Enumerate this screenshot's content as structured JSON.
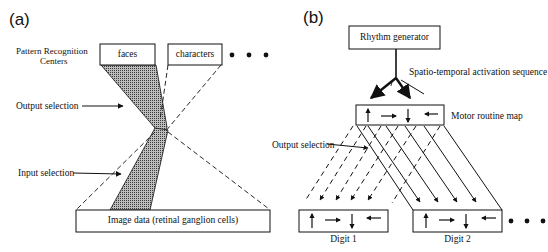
{
  "panel_a": {
    "label": "(a)",
    "pattern_recognition_label_line1": "Pattern Recognition",
    "pattern_recognition_label_line2": "Centers",
    "box_faces": "faces",
    "box_characters": "characters",
    "output_selection": "Output selection",
    "input_selection": "Input selection",
    "image_data": "Image data (retinal ganglion cells)"
  },
  "panel_b": {
    "label": "(b)",
    "rhythm_generator": "Rhythm generator",
    "activation_sequence": "Spatio-temporal activation sequence",
    "motor_routine_map": "Motor routine map",
    "output_selection": "Output selection",
    "digit_1": "Digit 1",
    "digit_2": "Digit 2",
    "arrow_glyphs": [
      "up",
      "right",
      "down",
      "left"
    ]
  },
  "colors": {
    "ink": "#111111",
    "shade": "#8a8a8a",
    "background": "#ffffff"
  }
}
